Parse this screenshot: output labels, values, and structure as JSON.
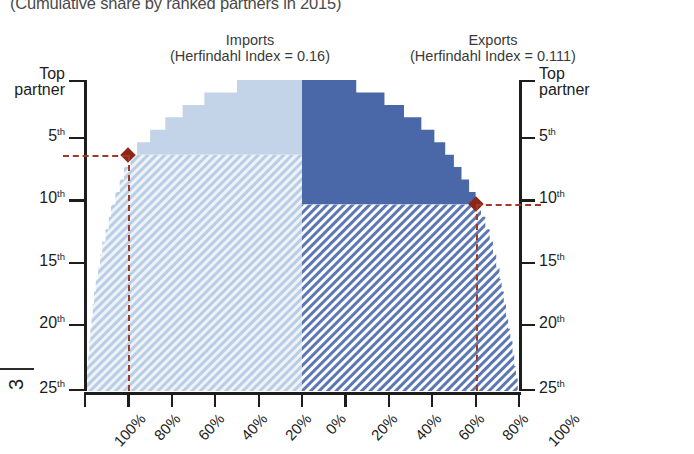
{
  "title": "(Cumulative share by ranked partners in 2015)",
  "page_number": "3",
  "panels": {
    "imports": {
      "name": "Imports",
      "sub": "(Herfindahl Index = 0.16)",
      "index_value": 0.16
    },
    "exports": {
      "name": "Exports",
      "sub": "(Herfindahl Index = 0.111)",
      "index_value": 0.111
    }
  },
  "axes": {
    "y_left_label_top": "Top partner",
    "y_right_label_top": "Top partner",
    "y_ticks": [
      "Top partner",
      "5",
      "10",
      "15",
      "20",
      "25"
    ],
    "y_tick_labels": [
      "Top partner",
      "5th",
      "10th",
      "15th",
      "20th",
      "25th"
    ],
    "y_ordinal_suffix": "th",
    "x_tick_labels": [
      "100%",
      "80%",
      "60%",
      "40%",
      "20%",
      "0%",
      "20%",
      "40%",
      "60%",
      "80%",
      "100%"
    ],
    "x_left_label": "",
    "x_right_label": ""
  },
  "colors": {
    "imports_solid": "#c3d4e8",
    "imports_hatch": "#b9cee4",
    "exports_solid": "#4a68a8",
    "exports_hatch": "#5b78b4",
    "marker": "#8f2418",
    "leader": "#9d3b26",
    "axis": "#1d1d1d"
  },
  "chart_data": {
    "type": "area",
    "title": "(Cumulative share by ranked partners in 2015)",
    "xlabel": "",
    "ylabel": "Partner rank",
    "orientation": "mirrored-horizontal",
    "x_tick_labels": [
      "100%",
      "80%",
      "60%",
      "40%",
      "20%",
      "0%",
      "20%",
      "40%",
      "60%",
      "80%",
      "100%"
    ],
    "xlim": [
      -100,
      100
    ],
    "ylim": [
      1,
      25
    ],
    "y_inverted": true,
    "grid": false,
    "legend": "none",
    "categories": [
      1,
      2,
      3,
      4,
      5,
      6,
      7,
      8,
      9,
      10,
      11,
      12,
      13,
      14,
      15,
      16,
      17,
      18,
      19,
      20,
      21,
      22,
      23,
      24,
      25
    ],
    "series": [
      {
        "name": "Imports",
        "side": "left",
        "herfindahl_index": 0.16,
        "values": [
          30,
          45,
          55,
          63,
          70,
          76,
          79,
          82,
          84,
          86,
          88,
          89,
          90.5,
          92,
          93,
          94,
          95,
          95.8,
          96.4,
          97,
          97.5,
          98,
          98.5,
          99,
          99.5
        ]
      },
      {
        "name": "Exports",
        "side": "right",
        "herfindahl_index": 0.111,
        "values": [
          25,
          38,
          47,
          55,
          61,
          66,
          70,
          73.5,
          77,
          80,
          82.5,
          84.5,
          86.5,
          88,
          89.5,
          91,
          92,
          93,
          94,
          95,
          96,
          97,
          97.8,
          98.6,
          99.4
        ]
      }
    ],
    "annotations": [
      {
        "series": "Imports",
        "label": "",
        "rank": 6,
        "cumulative_share_pct": 80,
        "marker": "diamond"
      },
      {
        "series": "Exports",
        "label": "",
        "rank": 10,
        "cumulative_share_pct": 80,
        "marker": "diamond"
      }
    ]
  }
}
